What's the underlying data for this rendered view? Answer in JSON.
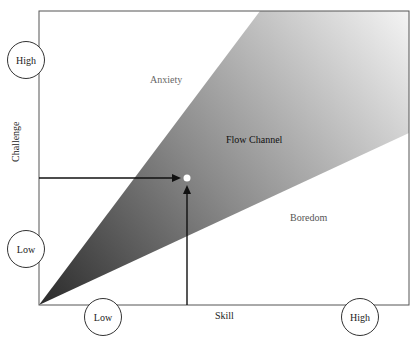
{
  "diagram": {
    "type": "flow-channel",
    "axes": {
      "x_label": "Skill",
      "y_label": "Challenge"
    },
    "x_markers": {
      "low": "Low",
      "high": "High"
    },
    "y_markers": {
      "low": "Low",
      "high": "High"
    },
    "regions": {
      "upper": "Anxiety",
      "middle": "Flow Channel",
      "lower": "Boredom"
    },
    "colors": {
      "wedge_dark": "#2a2a2a",
      "wedge_light": "#f2f2f2",
      "frame": "#555555",
      "arrow": "#111111",
      "point": "#ffffff"
    }
  }
}
